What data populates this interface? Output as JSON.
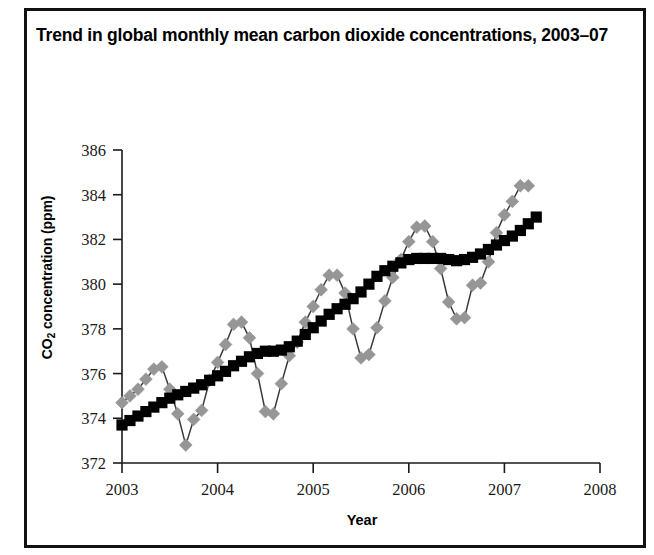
{
  "figure": {
    "title": "Trend in global monthly mean carbon dioxide concentrations, 2003–07",
    "border_color": "#111111",
    "background": "#ffffff"
  },
  "axes": {
    "xlabel": "Year",
    "ylabel_html": "CO2 concentration (ppm)",
    "ylabel_main": "CO",
    "ylabel_sub": "2",
    "ylabel_rest": " concentration (ppm)",
    "x_ticks": [
      "2003",
      "2004",
      "2005",
      "2006",
      "2007",
      "2008"
    ],
    "y_ticks": [
      "372",
      "374",
      "376",
      "378",
      "380",
      "382",
      "384",
      "386"
    ]
  },
  "chart_data": {
    "type": "line",
    "title": "Trend in global monthly mean carbon dioxide concentrations, 2003–07",
    "xlabel": "Year",
    "ylabel": "CO2 concentration (ppm)",
    "xlim": [
      2003.0,
      2008.0
    ],
    "ylim": [
      372,
      386
    ],
    "xticks": [
      2003,
      2004,
      2005,
      2006,
      2007,
      2008
    ],
    "yticks": [
      372,
      374,
      376,
      378,
      380,
      382,
      384,
      386
    ],
    "grid": false,
    "legend": "none",
    "series": [
      {
        "name": "Monthly mean CO2 concentration",
        "marker": "diamond",
        "color": "#969696",
        "line_color": "#3a3a3a",
        "x": [
          2003.0,
          2003.083,
          2003.167,
          2003.25,
          2003.333,
          2003.417,
          2003.5,
          2003.583,
          2003.667,
          2003.75,
          2003.833,
          2003.917,
          2004.0,
          2004.083,
          2004.167,
          2004.25,
          2004.333,
          2004.417,
          2004.5,
          2004.583,
          2004.667,
          2004.75,
          2004.833,
          2004.917,
          2005.0,
          2005.083,
          2005.167,
          2005.25,
          2005.333,
          2005.417,
          2005.5,
          2005.583,
          2005.667,
          2005.75,
          2005.833,
          2005.917,
          2006.0,
          2006.083,
          2006.167,
          2006.25,
          2006.333,
          2006.417,
          2006.5,
          2006.583,
          2006.667,
          2006.75,
          2006.833,
          2006.917,
          2007.0,
          2007.083,
          2007.167,
          2007.25
        ],
        "y": [
          374.7,
          375.0,
          375.3,
          375.75,
          376.2,
          376.3,
          375.3,
          374.2,
          372.8,
          373.95,
          374.35,
          375.7,
          376.5,
          377.3,
          378.2,
          378.3,
          377.6,
          376.0,
          374.3,
          374.2,
          375.55,
          376.8,
          377.4,
          378.3,
          379.0,
          379.75,
          380.4,
          380.4,
          379.6,
          378.0,
          376.7,
          376.85,
          378.05,
          379.25,
          380.3,
          381.1,
          381.9,
          382.55,
          382.6,
          381.9,
          380.7,
          379.2,
          378.45,
          378.5,
          379.95,
          380.05,
          381.0,
          382.3,
          383.1,
          383.7,
          384.4,
          384.4
        ]
      },
      {
        "name": "Trend (seasonally adjusted)",
        "marker": "square",
        "color": "#000000",
        "x": [
          2003.0,
          2003.083,
          2003.167,
          2003.25,
          2003.333,
          2003.417,
          2003.5,
          2003.583,
          2003.667,
          2003.75,
          2003.833,
          2003.917,
          2004.0,
          2004.083,
          2004.167,
          2004.25,
          2004.333,
          2004.417,
          2004.5,
          2004.583,
          2004.667,
          2004.75,
          2004.833,
          2004.917,
          2005.0,
          2005.083,
          2005.167,
          2005.25,
          2005.333,
          2005.417,
          2005.5,
          2005.583,
          2005.667,
          2005.75,
          2005.833,
          2005.917,
          2006.0,
          2006.083,
          2006.167,
          2006.25,
          2006.333,
          2006.417,
          2006.5,
          2006.583,
          2006.667,
          2006.75,
          2006.833,
          2006.917,
          2007.0,
          2007.083,
          2007.167,
          2007.25,
          2007.333
        ],
        "y": [
          373.7,
          373.9,
          374.1,
          374.3,
          374.5,
          374.7,
          374.9,
          375.05,
          375.2,
          375.35,
          375.5,
          375.7,
          375.9,
          376.1,
          376.35,
          376.55,
          376.75,
          376.9,
          377.0,
          377.0,
          377.05,
          377.2,
          377.45,
          377.75,
          378.05,
          378.35,
          378.65,
          378.9,
          379.1,
          379.35,
          379.65,
          380.0,
          380.35,
          380.6,
          380.8,
          380.95,
          381.1,
          381.15,
          381.15,
          381.15,
          381.15,
          381.1,
          381.05,
          381.1,
          381.2,
          381.35,
          381.55,
          381.75,
          381.95,
          382.15,
          382.4,
          382.7,
          383.0
        ]
      }
    ]
  }
}
